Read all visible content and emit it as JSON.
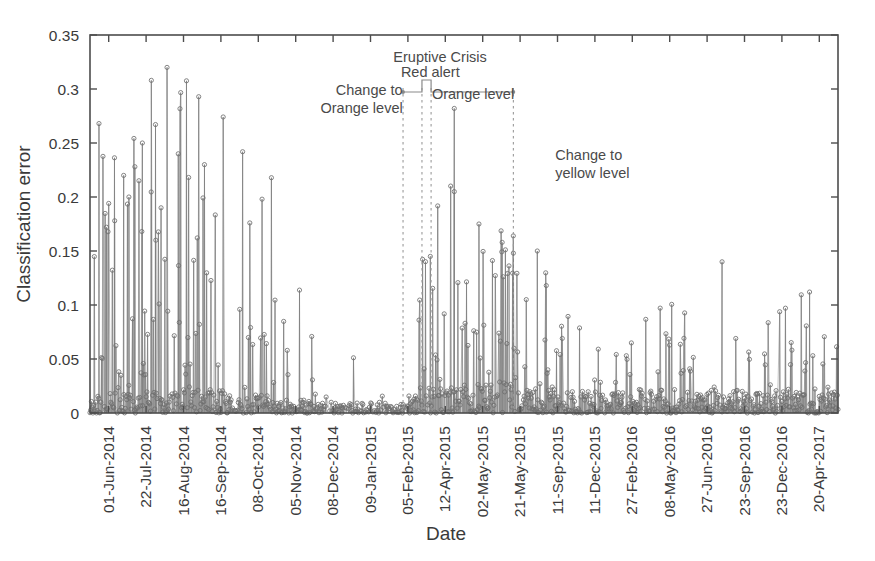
{
  "chart_data": {
    "type": "line",
    "title": "",
    "xlabel": "Date",
    "ylabel": "Classification error",
    "ylim": [
      0,
      0.35
    ],
    "ytick_labels": [
      "0",
      "0.05",
      "0.1",
      "0.15",
      "0.2",
      "0.25",
      "0.3",
      "0.35"
    ],
    "ytick_values": [
      0,
      0.05,
      0.1,
      0.15,
      0.2,
      0.25,
      0.3,
      0.35
    ],
    "xtick_labels": [
      "01-Jun-2014",
      "22-Jul-2014",
      "16-Aug-2014",
      "16-Sep-2014",
      "08-Oct-2014",
      "05-Nov-2014",
      "08-Dec-2014",
      "09-Jan-2015",
      "05-Feb-2015",
      "12-Apr-2015",
      "02-May-2015",
      "21-May-2015",
      "11-Sep-2015",
      "11-Dec-2015",
      "27-Feb-2016",
      "08-May-2016",
      "27-Jun-2016",
      "23-Sep-2016",
      "23-Dec-2016",
      "20-Apr-2017"
    ],
    "grid": false,
    "legend": "none",
    "marker": "open-circle",
    "series_name": "Classification error",
    "n_points": 1040,
    "annotations": [
      {
        "id": "change-to-orange",
        "text_lines": [
          "Change to",
          "Orange level"
        ],
        "x_frac": 0.418,
        "anchor": "right"
      },
      {
        "id": "eruptive-crisis",
        "text_lines": [
          "Eruptive Crisis"
        ],
        "x_frac": 0.468,
        "anchor": "middle"
      },
      {
        "id": "red-alert",
        "text_lines": [
          "Red alert"
        ],
        "x_frac": 0.455,
        "anchor": "middle"
      },
      {
        "id": "orange-level",
        "text_lines": [
          "Orange level"
        ],
        "x_frac": 0.512,
        "anchor": "middle"
      },
      {
        "id": "change-to-yellow",
        "text_lines": [
          "Change to",
          "yellow level"
        ],
        "x_frac": 0.622,
        "anchor": "left"
      }
    ],
    "guide_lines_x_frac": [
      0.4185,
      0.4438,
      0.456,
      0.566
    ],
    "profile_description": "Stem plot of daily classification error; high sparse spikes to 0.32 in Jun-Aug 2014, quiet low band Sep 2014-Jan 2015, renewed activity with peaks to 0.28 during the Feb-May 2015 eruptive crisis, then a dense moderate band below 0.12 through Apr 2017.",
    "segments": [
      {
        "start_frac": 0.0,
        "end_frac": 0.075,
        "density": 0.92,
        "base": 0.012,
        "base_spread": 0.018,
        "spike_rate": 0.3,
        "spike_max": 0.275,
        "spike_bias": 1.9
      },
      {
        "start_frac": 0.075,
        "end_frac": 0.18,
        "density": 0.94,
        "base": 0.014,
        "base_spread": 0.022,
        "spike_rate": 0.33,
        "spike_max": 0.325,
        "spike_bias": 1.7
      },
      {
        "start_frac": 0.18,
        "end_frac": 0.25,
        "density": 0.9,
        "base": 0.012,
        "base_spread": 0.02,
        "spike_rate": 0.24,
        "spike_max": 0.245,
        "spike_bias": 2.0
      },
      {
        "start_frac": 0.25,
        "end_frac": 0.3,
        "density": 0.8,
        "base": 0.008,
        "base_spread": 0.013,
        "spike_rate": 0.1,
        "spike_max": 0.115,
        "spike_bias": 2.4
      },
      {
        "start_frac": 0.3,
        "end_frac": 0.418,
        "density": 0.72,
        "base": 0.006,
        "base_spread": 0.01,
        "spike_rate": 0.06,
        "spike_max": 0.052,
        "spike_bias": 2.6
      },
      {
        "start_frac": 0.418,
        "end_frac": 0.444,
        "density": 0.88,
        "base": 0.01,
        "base_spread": 0.016,
        "spike_rate": 0.22,
        "spike_max": 0.145,
        "spike_bias": 2.0
      },
      {
        "start_frac": 0.444,
        "end_frac": 0.5,
        "density": 0.96,
        "base": 0.016,
        "base_spread": 0.026,
        "spike_rate": 0.3,
        "spike_max": 0.285,
        "spike_bias": 1.8
      },
      {
        "start_frac": 0.5,
        "end_frac": 0.566,
        "density": 0.97,
        "base": 0.02,
        "base_spread": 0.03,
        "spike_rate": 0.34,
        "spike_max": 0.175,
        "spike_bias": 1.5
      },
      {
        "start_frac": 0.566,
        "end_frac": 0.64,
        "density": 0.97,
        "base": 0.018,
        "base_spread": 0.028,
        "spike_rate": 0.3,
        "spike_max": 0.16,
        "spike_bias": 1.6
      },
      {
        "start_frac": 0.64,
        "end_frac": 0.73,
        "density": 0.93,
        "base": 0.012,
        "base_spread": 0.02,
        "spike_rate": 0.2,
        "spike_max": 0.095,
        "spike_bias": 1.9
      },
      {
        "start_frac": 0.73,
        "end_frac": 0.83,
        "density": 0.95,
        "base": 0.013,
        "base_spread": 0.022,
        "spike_rate": 0.24,
        "spike_max": 0.105,
        "spike_bias": 1.8
      },
      {
        "start_frac": 0.83,
        "end_frac": 0.93,
        "density": 0.95,
        "base": 0.013,
        "base_spread": 0.021,
        "spike_rate": 0.22,
        "spike_max": 0.1,
        "spike_bias": 1.8
      },
      {
        "start_frac": 0.93,
        "end_frac": 1.0,
        "density": 0.94,
        "base": 0.012,
        "base_spread": 0.02,
        "spike_rate": 0.22,
        "spike_max": 0.115,
        "spike_bias": 1.8
      }
    ],
    "named_peaks": [
      {
        "x_frac": 0.012,
        "value": 0.268
      },
      {
        "x_frac": 0.103,
        "value": 0.32
      },
      {
        "x_frac": 0.082,
        "value": 0.308
      },
      {
        "x_frac": 0.07,
        "value": 0.25
      },
      {
        "x_frac": 0.118,
        "value": 0.24
      },
      {
        "x_frac": 0.06,
        "value": 0.228
      },
      {
        "x_frac": 0.045,
        "value": 0.22
      },
      {
        "x_frac": 0.052,
        "value": 0.2
      },
      {
        "x_frac": 0.095,
        "value": 0.19
      },
      {
        "x_frac": 0.022,
        "value": 0.172
      },
      {
        "x_frac": 0.033,
        "value": 0.178
      },
      {
        "x_frac": 0.088,
        "value": 0.16
      },
      {
        "x_frac": 0.487,
        "value": 0.282
      },
      {
        "x_frac": 0.487,
        "value": 0.205
      },
      {
        "x_frac": 0.455,
        "value": 0.145
      },
      {
        "x_frac": 0.52,
        "value": 0.175
      },
      {
        "x_frac": 0.551,
        "value": 0.158
      },
      {
        "x_frac": 0.598,
        "value": 0.15
      },
      {
        "x_frac": 0.566,
        "value": 0.148
      },
      {
        "x_frac": 0.61,
        "value": 0.118
      },
      {
        "x_frac": 0.845,
        "value": 0.14
      },
      {
        "x_frac": 0.962,
        "value": 0.112
      }
    ]
  },
  "figure": {
    "plot_left": 90,
    "plot_right": 838,
    "plot_top": 35,
    "plot_bottom": 413
  }
}
